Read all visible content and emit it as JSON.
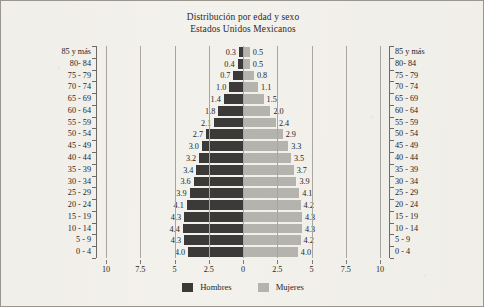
{
  "chart_data": {
    "type": "bar",
    "subtype": "population-pyramid",
    "title": "Distribución por edad y sexo",
    "subtitle": "Estados Unidos Mexicanos",
    "xlabel": "",
    "ylabel": "",
    "xlim": [
      10,
      10
    ],
    "xticks": [
      "10",
      "7.5",
      "5",
      "2.5",
      "0",
      "2.5",
      "5",
      "7.5",
      "10"
    ],
    "xtick_values": [
      -10,
      -7.5,
      -5,
      -2.5,
      0,
      2.5,
      5,
      7.5,
      10
    ],
    "grid": true,
    "grid_axis": "x",
    "legend_position": "bottom",
    "categories": [
      "85 y más",
      "80- 84",
      "75 - 79",
      "70 - 74",
      "65 - 69",
      "60 - 64",
      "55 - 59",
      "50 - 54",
      "45 - 49",
      "40 - 44",
      "35 - 39",
      "30 - 34",
      "25 - 29",
      "20 - 24",
      "15 - 19",
      "10 - 14",
      "5 - 9",
      "0 - 4"
    ],
    "series": [
      {
        "name": "Hombres",
        "color": "#3b3a38",
        "side": "left",
        "values": [
          0.3,
          0.4,
          0.7,
          1.0,
          1.4,
          1.8,
          2.1,
          2.7,
          3.0,
          3.2,
          3.4,
          3.6,
          3.9,
          4.1,
          4.3,
          4.4,
          4.3,
          4.0
        ]
      },
      {
        "name": "Mujeres",
        "color": "#b5b3ad",
        "side": "right",
        "values": [
          0.5,
          0.5,
          0.8,
          1.1,
          1.5,
          2.0,
          2.4,
          2.9,
          3.3,
          3.5,
          3.7,
          3.9,
          4.1,
          4.2,
          4.3,
          4.3,
          4.2,
          4.0
        ]
      }
    ]
  },
  "legend": {
    "items": [
      {
        "label": "Hombres",
        "color": "#3b3a38"
      },
      {
        "label": "Mujeres",
        "color": "#b5b3ad"
      }
    ]
  }
}
